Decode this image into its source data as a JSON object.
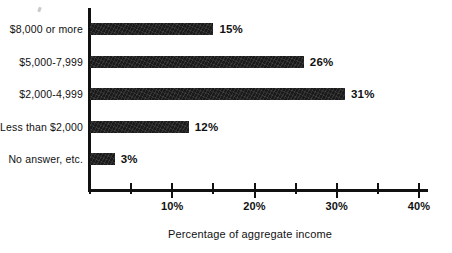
{
  "chart_data": {
    "type": "bar",
    "orientation": "horizontal",
    "title": "",
    "subtitle": "",
    "xlabel": "Percentage of aggregate income",
    "ylabel": "",
    "categories": [
      "$8,000 or more",
      "$5,000-7,999",
      "$2,000-4,999",
      "Less than $2,000",
      "No answer, etc."
    ],
    "values": [
      15,
      26,
      31,
      12,
      3
    ],
    "value_labels": [
      "15%",
      "26%",
      "31%",
      "12%",
      "3%"
    ],
    "xlim": [
      0,
      40
    ],
    "xticks": [
      0,
      5,
      10,
      15,
      20,
      25,
      30,
      35,
      40
    ],
    "xtick_labels": [
      "",
      "",
      "10%",
      "",
      "20%",
      "",
      "30%",
      "",
      "40%"
    ],
    "major_xticks": [
      10,
      20,
      30,
      40
    ],
    "minor_xticks": [
      0,
      5,
      15,
      25,
      35
    ],
    "grid": false,
    "legend": false,
    "legend_position": "none",
    "bar_color": "#1a1a1a",
    "axis_color": "#111111",
    "background_color": "#ffffff"
  },
  "figure": {
    "axis_title": "Percentage of aggregate income"
  }
}
